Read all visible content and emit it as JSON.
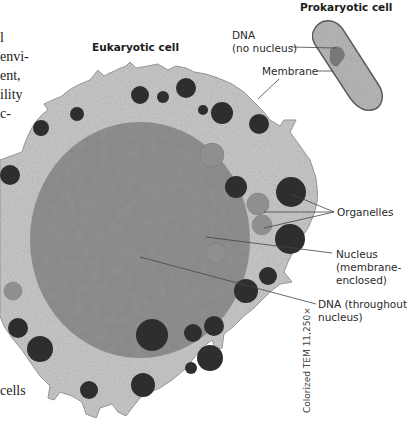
{
  "figure": {
    "eukaryotic_title": "Eukaryotic cell",
    "prokaryotic_title": "Prokaryotic cell",
    "labels": {
      "dna_no_nucleus_line1": "DNA",
      "dna_no_nucleus_line2": "(no nucleus)",
      "membrane": "Membrane",
      "organelles": "Organelles",
      "nucleus_line1": "Nucleus",
      "nucleus_line2": "(membrane-",
      "nucleus_line3": "enclosed)",
      "dna_throughout_line1": "DNA (throughout",
      "dna_throughout_line2": "nucleus)"
    },
    "micrograph_caption": "Colorized TEM 11,250×"
  },
  "cropped_body_text": {
    "line1": "l",
    "line2": "envi-",
    "line3": "ent,",
    "line4": "ility",
    "line5": "c-",
    "line6": "cells"
  },
  "colors": {
    "cytoplasm": "#c9c9c9",
    "nucleus": "#8a8a8a",
    "dark_organelle": "#2e2e2e",
    "light_organelle": "#8f8f8f",
    "bacterium": "#b8b8b8",
    "bacterium_outline": "#555555",
    "leader_line": "#444444"
  }
}
